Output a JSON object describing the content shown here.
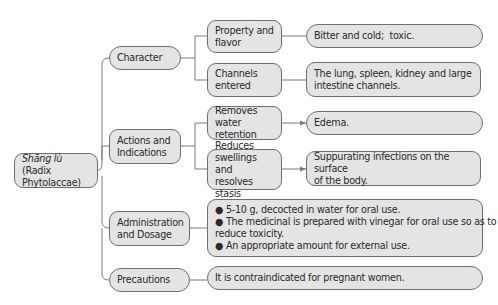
{
  "root": {
    "italic": "Shāng lù",
    "rest": " (Radix",
    "line2": "Phytolaccae)"
  },
  "categories": [
    {
      "label": "Character"
    },
    {
      "label_1": "Actions and",
      "label_2": "Indications"
    },
    {
      "label_1": "Administration",
      "label_2": "and Dosage"
    },
    {
      "label": "Precautions"
    }
  ],
  "character": {
    "property_1": "Property and",
    "property_2": "flavor",
    "property_value": "Bitter and cold;  toxic.",
    "channels_1": "Channels",
    "channels_2": "entered",
    "channels_value_1": "The lung, spleen, kidney and large",
    "channels_value_2": "intestine channels."
  },
  "actions": {
    "removes_1": "Removes water",
    "removes_2": "retention",
    "removes_value": "Edema.",
    "reduces_1": "Reduces",
    "reduces_2": "swellings and",
    "reduces_3": "resolves stasis",
    "reduces_value_1": "Suppurating infections on the surface",
    "reduces_value_2": "of the body."
  },
  "administration": {
    "bullets": [
      "● 5-10 g, decocted in water for oral use.",
      "● The medicinal is prepared with vinegar for oral use so as to",
      "reduce toxicity.",
      "● An appropriate amount for external use."
    ]
  },
  "precautions": {
    "value": "It is contraindicated for pregnant women."
  },
  "colors": {
    "box_fill": "#e4e4e4",
    "border": "#6e6e6e"
  }
}
